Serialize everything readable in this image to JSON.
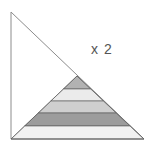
{
  "diagram": {
    "label": "x 2",
    "outer_triangle": {
      "points": [
        [
          11,
          12
        ],
        [
          11,
          139
        ],
        [
          144,
          139
        ]
      ],
      "stroke": "#8c8c8c",
      "fill": "#ffffff"
    },
    "inner_triangle": {
      "apex": [
        77,
        76
      ],
      "base_left": [
        11,
        139
      ],
      "base_right": [
        144,
        139
      ],
      "stroke": "#555555"
    },
    "stripes": [
      {
        "y_top": 76,
        "y_bottom": 89,
        "fill": "#b2b2b2"
      },
      {
        "y_top": 89,
        "y_bottom": 101,
        "fill": "#ebebeb"
      },
      {
        "y_top": 101,
        "y_bottom": 113,
        "fill": "#cfcfcf"
      },
      {
        "y_top": 113,
        "y_bottom": 126,
        "fill": "#9c9c9c"
      },
      {
        "y_top": 126,
        "y_bottom": 139,
        "fill": "#f2f2f2"
      }
    ]
  }
}
